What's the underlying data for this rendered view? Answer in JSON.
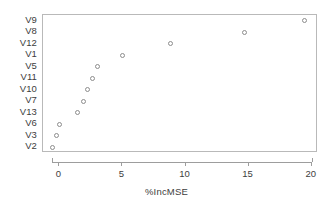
{
  "chart_data": {
    "type": "scatter",
    "title": "",
    "subtitle": "",
    "xlabel": "%IncMSE",
    "ylabel": "",
    "xlim": [
      -1.3,
      20.5
    ],
    "xticks": [
      0,
      5,
      10,
      15,
      20
    ],
    "xticklabels": [
      "0",
      "5",
      "10",
      "15",
      "20"
    ],
    "grid": false,
    "legend": null,
    "orientation": "horizontal-dotchart",
    "marker": "open-circle",
    "marker_color": "#8d8d8d",
    "frame_color": "#b9b9b9",
    "categories": [
      "V9",
      "V8",
      "V12",
      "V1",
      "V5",
      "V11",
      "V10",
      "V7",
      "V13",
      "V6",
      "V3",
      "V2"
    ],
    "values": [
      19.4,
      14.7,
      8.8,
      5.0,
      3.0,
      2.6,
      2.2,
      1.9,
      1.4,
      0.0,
      -0.25,
      -0.55
    ],
    "points": [
      {
        "label": "V9",
        "value": 19.4
      },
      {
        "label": "V8",
        "value": 14.7
      },
      {
        "label": "V12",
        "value": 8.8
      },
      {
        "label": "V1",
        "value": 5.0
      },
      {
        "label": "V5",
        "value": 3.0
      },
      {
        "label": "V11",
        "value": 2.6
      },
      {
        "label": "V10",
        "value": 2.2
      },
      {
        "label": "V7",
        "value": 1.9
      },
      {
        "label": "V13",
        "value": 1.4
      },
      {
        "label": "V6",
        "value": 0.0
      },
      {
        "label": "V3",
        "value": -0.25
      },
      {
        "label": "V2",
        "value": -0.55
      }
    ]
  }
}
